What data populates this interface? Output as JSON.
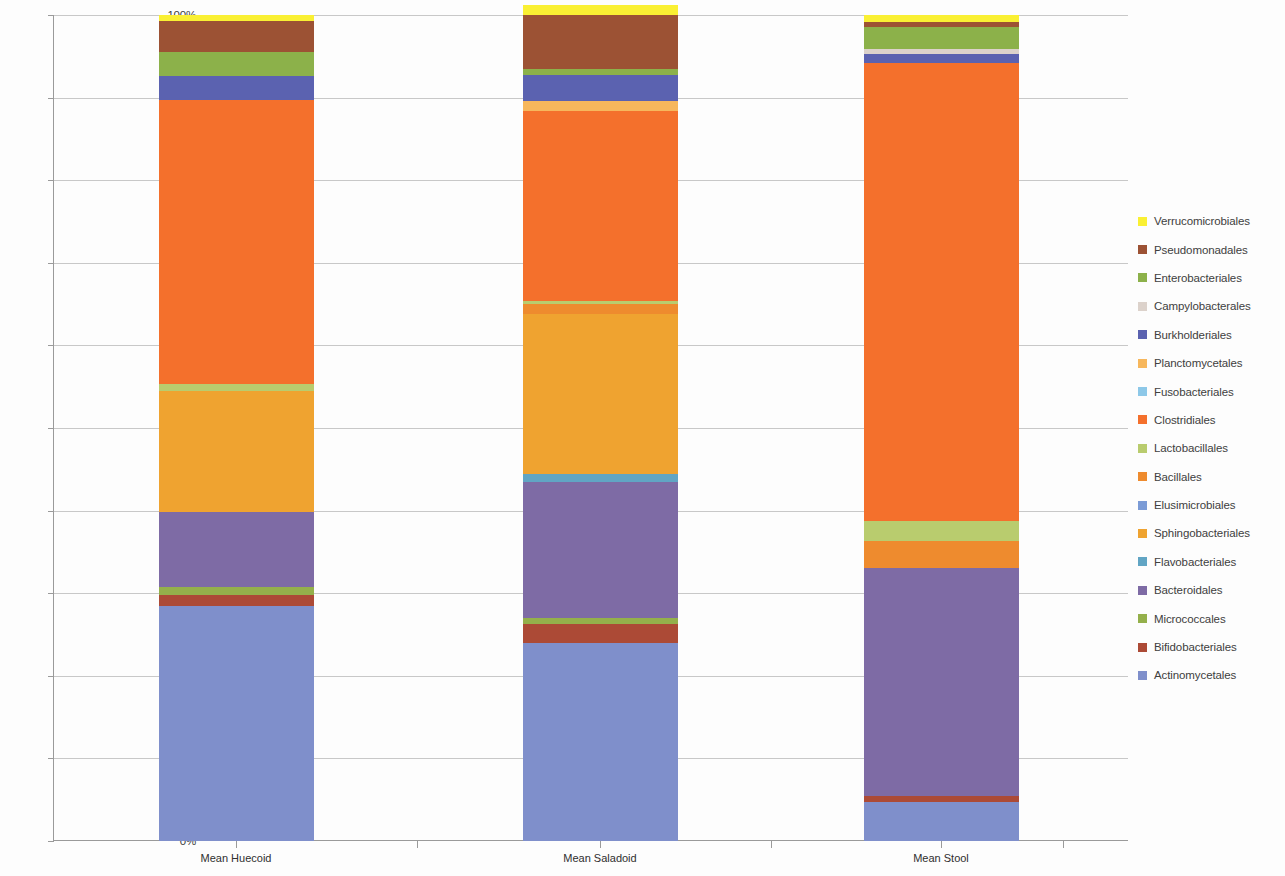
{
  "chart_data": {
    "type": "bar",
    "subtype": "stacked-percentage",
    "title": "",
    "xlabel": "",
    "ylabel": "",
    "ylim": [
      0,
      100
    ],
    "ytick_labels": [
      "0%",
      "10%",
      "20%",
      "30%",
      "40%",
      "50%",
      "60%",
      "70%",
      "80%",
      "90%",
      "100%"
    ],
    "ytick_values": [
      0,
      10,
      20,
      30,
      40,
      50,
      60,
      70,
      80,
      90,
      100
    ],
    "grid": true,
    "legend_position": "right",
    "categories": [
      "Mean Huecoid",
      "Mean Saladoid",
      "Mean Stool"
    ],
    "series": [
      {
        "name": "Actinomycetales",
        "color": "#7F8FCB",
        "values": [
          28.5,
          24.0,
          4.7
        ]
      },
      {
        "name": "Bifidobacteriales",
        "color": "#AC4A36",
        "values": [
          1.3,
          2.3,
          0.8
        ]
      },
      {
        "name": "Micrococcales",
        "color": "#94B04B",
        "values": [
          1.0,
          0.7,
          0.0
        ]
      },
      {
        "name": "Bacteroidales",
        "color": "#7E6BA5",
        "values": [
          9.0,
          16.5,
          27.5
        ]
      },
      {
        "name": "Flavobacteriales",
        "color": "#61A5C4",
        "values": [
          0.0,
          0.9,
          0.0
        ]
      },
      {
        "name": "Sphingobacteriales",
        "color": "#EFA330",
        "values": [
          14.7,
          19.4,
          0.0
        ]
      },
      {
        "name": "Elusimicrobiales",
        "color": "#7B9BD6",
        "values": [
          0.0,
          0.0,
          0.0
        ]
      },
      {
        "name": "Bacillales",
        "color": "#EE8B2E",
        "values": [
          0.0,
          1.2,
          3.3
        ]
      },
      {
        "name": "Lactobacillales",
        "color": "#B9CC6E",
        "values": [
          0.8,
          0.4,
          2.4
        ]
      },
      {
        "name": "Clostridiales",
        "color": "#F4702C",
        "values": [
          34.4,
          23.0,
          55.5
        ]
      },
      {
        "name": "Fusobacteriales",
        "color": "#8DC8E8",
        "values": [
          0.0,
          0.0,
          0.0
        ]
      },
      {
        "name": "Planctomycetales",
        "color": "#F7B75C",
        "values": [
          0.0,
          1.2,
          0.0
        ]
      },
      {
        "name": "Burkholderiales",
        "color": "#5B62B0",
        "values": [
          2.9,
          3.1,
          1.1
        ]
      },
      {
        "name": "Campylobacterales",
        "color": "#DCD2CB",
        "values": [
          0.0,
          0.0,
          0.6
        ]
      },
      {
        "name": "Enterobacteriales",
        "color": "#8CB14A",
        "values": [
          2.9,
          0.8,
          2.6
        ]
      },
      {
        "name": "Pseudomonadales",
        "color": "#9C5234",
        "values": [
          3.8,
          6.5,
          0.7
        ]
      },
      {
        "name": "Verrucomicrobiales",
        "color": "#FAF033",
        "values": [
          0.7,
          1.2,
          0.8
        ]
      }
    ],
    "stack_order_bottom_to_top": [
      "Actinomycetales",
      "Bifidobacteriales",
      "Micrococcales",
      "Bacteroidales",
      "Flavobacteriales",
      "Sphingobacteriales",
      "Elusimicrobiales",
      "Bacillales",
      "Lactobacillales",
      "Clostridiales",
      "Fusobacteriales",
      "Planctomycetales",
      "Burkholderiales",
      "Campylobacterales",
      "Enterobacteriales",
      "Pseudomonadales",
      "Verrucomicrobiales"
    ]
  },
  "legend": {
    "items": [
      {
        "label": "Verrucomicrobiales",
        "color": "#FAF033"
      },
      {
        "label": "Pseudomonadales",
        "color": "#9C5234"
      },
      {
        "label": "Enterobacteriales",
        "color": "#8CB14A"
      },
      {
        "label": "Campylobacterales",
        "color": "#DCD2CB"
      },
      {
        "label": "Burkholderiales",
        "color": "#5B62B0"
      },
      {
        "label": "Planctomycetales",
        "color": "#F7B75C"
      },
      {
        "label": "Fusobacteriales",
        "color": "#8DC8E8"
      },
      {
        "label": "Clostridiales",
        "color": "#F4702C"
      },
      {
        "label": "Lactobacillales",
        "color": "#B9CC6E"
      },
      {
        "label": "Bacillales",
        "color": "#EE8B2E"
      },
      {
        "label": "Elusimicrobiales",
        "color": "#7B9BD6"
      },
      {
        "label": "Sphingobacteriales",
        "color": "#EFA330"
      },
      {
        "label": "Flavobacteriales",
        "color": "#61A5C4"
      },
      {
        "label": "Bacteroidales",
        "color": "#7E6BA5"
      },
      {
        "label": "Micrococcales",
        "color": "#94B04B"
      },
      {
        "label": "Bifidobacteriales",
        "color": "#AC4A36"
      },
      {
        "label": "Actinomycetales",
        "color": "#7F8FCB"
      }
    ]
  },
  "axes": {
    "y_ticks": [
      "100%",
      "90%",
      "80%",
      "70%",
      "60%",
      "50%",
      "40%",
      "30%",
      "20%",
      "10%",
      "0%"
    ],
    "x_ticks": [
      "Mean Huecoid",
      "Mean Saladoid",
      "Mean Stool"
    ]
  }
}
